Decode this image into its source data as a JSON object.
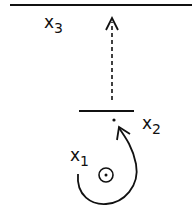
{
  "diagram": {
    "labels": {
      "x3": {
        "base": "x",
        "sub": "3"
      },
      "x2": {
        "base": "x",
        "sub": "2"
      },
      "x1": {
        "base": "x",
        "sub": "1"
      }
    },
    "elements": [
      "top-horizontal-line",
      "dashed-up-arrow",
      "short-horizontal-line",
      "point-dot",
      "curved-loop-arrow",
      "circled-dot"
    ],
    "stroke_color": "#111111"
  }
}
